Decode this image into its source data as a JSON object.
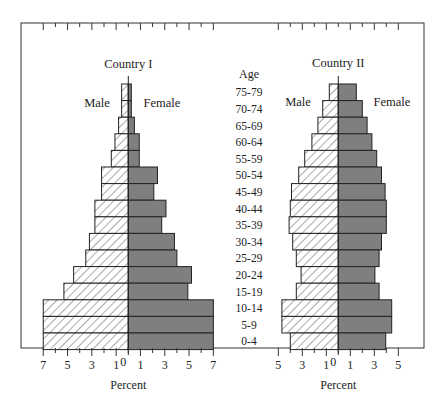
{
  "chart_data": {
    "type": "bar",
    "subtype": "population-pyramid",
    "title": "",
    "center_label": "Age",
    "age_groups": [
      "75-79",
      "70-74",
      "65-69",
      "60-64",
      "55-59",
      "50-54",
      "45-49",
      "40-44",
      "35-39",
      "30-34",
      "25-29",
      "20-24",
      "15-19",
      "10-14",
      "5-9",
      "0-4"
    ],
    "panels": [
      {
        "name": "Country I",
        "left_label": "Male",
        "right_label": "Female",
        "xlabel": "Percent",
        "xlim": [
          -7,
          7
        ],
        "tick_labels": [
          "7",
          "5",
          "3",
          "1",
          "0",
          "1",
          "3",
          "5",
          "7"
        ],
        "series": [
          {
            "name": "Male",
            "style": "hatched",
            "values": [
              0.55,
              0.55,
              0.8,
              1.1,
              1.4,
              2.2,
              2.2,
              2.75,
              2.75,
              3.2,
              3.5,
              4.5,
              5.3,
              7.0,
              7.0,
              7.0
            ]
          },
          {
            "name": "Female",
            "style": "solid-gray",
            "values": [
              0.25,
              0.25,
              0.5,
              0.9,
              0.9,
              2.4,
              2.1,
              3.1,
              2.75,
              3.8,
              4.0,
              5.2,
              4.9,
              7.0,
              7.0,
              7.0
            ]
          }
        ]
      },
      {
        "name": "Country II",
        "left_label": "Male",
        "right_label": "Female",
        "xlabel": "Percent",
        "xlim": [
          -5,
          5
        ],
        "tick_labels": [
          "5",
          "3",
          "1",
          "0",
          "1",
          "3",
          "5"
        ],
        "series": [
          {
            "name": "Male",
            "style": "hatched",
            "values": [
              0.75,
              1.3,
              1.7,
              2.2,
              2.8,
              3.3,
              3.9,
              4.0,
              4.1,
              3.8,
              3.5,
              3.1,
              3.5,
              4.7,
              4.7,
              4.0
            ]
          },
          {
            "name": "Female",
            "style": "solid-gray",
            "values": [
              1.5,
              2.0,
              2.4,
              2.8,
              3.2,
              3.6,
              3.9,
              4.0,
              4.0,
              3.6,
              3.4,
              3.05,
              3.4,
              4.45,
              4.45,
              3.95
            ]
          }
        ]
      }
    ],
    "grid": false,
    "legend": "none (Male/Female text labels inside panels)"
  },
  "colors": {
    "male_hatch": "#555555",
    "male_fill": "#ffffff",
    "female_fill": "#7f7f7f",
    "bar_stroke": "#222222",
    "frame": "#333333"
  }
}
